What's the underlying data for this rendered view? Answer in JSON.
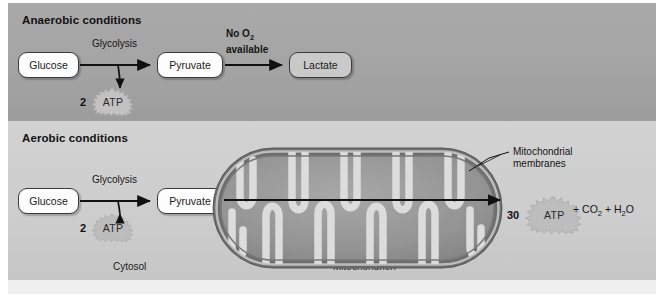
{
  "figure": {
    "width": 664,
    "height": 303,
    "colors": {
      "anaerobic_band": "#a4a4a4",
      "aerobic_band": "#cdcdcd",
      "box_stroke": "#3a3a3a",
      "box_fill_white": "#fdfdfd",
      "box_fill_gray": "#c9c9c9",
      "arrow": "#111111",
      "mitochondrion_outer": "#6f6f6f",
      "mitochondrion_matrix": "#9a9a9a",
      "cristae": "#d8d8d8"
    }
  },
  "anaerobic": {
    "title": "Anaerobic conditions",
    "glucose_label": "Glucose",
    "glycolysis_label": "Glycolysis",
    "pyruvate_label": "Pyruvate",
    "no_o2_line1": "No O",
    "no_o2_sub": "2",
    "no_o2_line2": "available",
    "lactate_label": "Lactate",
    "atp_count": "2",
    "atp_label": "ATP"
  },
  "aerobic": {
    "title": "Aerobic conditions",
    "glucose_label": "Glucose",
    "glycolysis_label": "Glycolysis",
    "pyruvate_label": "Pyruvate",
    "atp_count": "2",
    "atp_label": "ATP",
    "o2_available_prefix": "O",
    "o2_available_sub": "2",
    "o2_available_suffix": " available",
    "pathway_label": "Citric acid cycle/Oxidative phosphorylation",
    "atp_yield_count": "30",
    "atp_yield_label": "ATP",
    "products": "+ CO₂ + H₂O",
    "cytosol_label": "Cytosol",
    "mitochondrion_label": "Mitochondrion",
    "membranes_line1": "Mitochondrial",
    "membranes_line2": "membranes"
  }
}
